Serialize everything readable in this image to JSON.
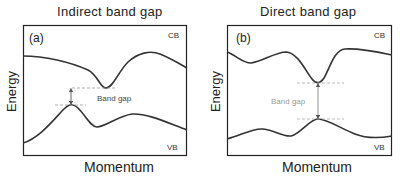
{
  "panels": [
    {
      "id": "a",
      "title": "Indirect band gap",
      "panel_label": "(a)",
      "ylabel": "Energy",
      "xlabel": "Momentum",
      "cb_label": "CB",
      "vb_label": "VB",
      "gap_label": "Band gap",
      "gap_label_color": "#444444"
    },
    {
      "id": "b",
      "title": "Direct band gap",
      "panel_label": "(b)",
      "ylabel": "Energy",
      "xlabel": "Momentum",
      "cb_label": "CB",
      "vb_label": "VB",
      "gap_label": "Band gap",
      "gap_label_color": "#999999"
    }
  ],
  "colors": {
    "curve": "#333333",
    "frame": "#222222",
    "dashed": "#999999",
    "arrow": "#555555"
  }
}
